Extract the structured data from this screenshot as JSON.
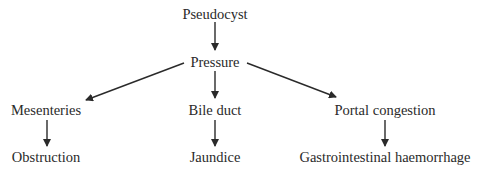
{
  "diagram": {
    "nodes": [
      {
        "id": "pseudocyst",
        "label": "Pseudocyst",
        "x": 215,
        "y": 14
      },
      {
        "id": "pressure",
        "label": "Pressure",
        "x": 215,
        "y": 62
      },
      {
        "id": "mesenteries",
        "label": "Mesenteries",
        "x": 46,
        "y": 110
      },
      {
        "id": "bile_duct",
        "label": "Bile duct",
        "x": 215,
        "y": 110
      },
      {
        "id": "portal_congestion",
        "label": "Portal congestion",
        "x": 385,
        "y": 110
      },
      {
        "id": "obstruction",
        "label": "Obstruction",
        "x": 46,
        "y": 157
      },
      {
        "id": "jaundice",
        "label": "Jaundice",
        "x": 215,
        "y": 157
      },
      {
        "id": "gi_haemorrhage",
        "label": "Gastrointestinal haemorrhage",
        "x": 385,
        "y": 157
      }
    ],
    "edges": [
      {
        "from": "pseudocyst",
        "to": "pressure"
      },
      {
        "from": "pressure",
        "to": "mesenteries"
      },
      {
        "from": "pressure",
        "to": "bile_duct"
      },
      {
        "from": "pressure",
        "to": "portal_congestion"
      },
      {
        "from": "mesenteries",
        "to": "obstruction"
      },
      {
        "from": "bile_duct",
        "to": "jaundice"
      },
      {
        "from": "portal_congestion",
        "to": "gi_haemorrhage"
      }
    ],
    "colors": {
      "line": "#2a2a2a",
      "text": "#2a2a2a",
      "background": "#ffffff"
    }
  }
}
